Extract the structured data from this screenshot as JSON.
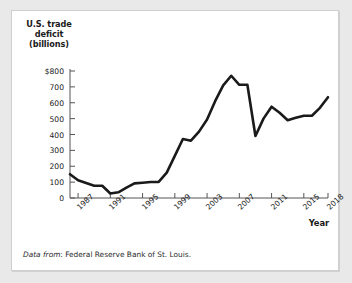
{
  "figure": {
    "y_axis_title": "U.S. trade deficit (billions)",
    "x_axis_title": "Year",
    "source_lead": "Data from",
    "source_text": ": Federal Reserve Bank of St. Louis.",
    "line_color": "#1a1a1a",
    "axis_color": "#555555",
    "panel_background": "#ffffff",
    "page_background": "#e9e9e9"
  },
  "chart_data": {
    "type": "line",
    "title": "",
    "subtitle": "",
    "xlabel": "Year",
    "ylabel": "U.S. trade deficit (billions)",
    "xlim": [
      1986,
      2018
    ],
    "ylim": [
      0,
      800
    ],
    "grid": false,
    "legend": "none",
    "y_ticks": [
      0,
      100,
      200,
      300,
      400,
      500,
      600,
      700,
      800
    ],
    "y_tick_labels": [
      "0",
      "100",
      "200",
      "300",
      "400",
      "500",
      "600",
      "700",
      "$800"
    ],
    "x_ticks": [
      1987,
      1991,
      1995,
      1999,
      2003,
      2007,
      2011,
      2015,
      2018
    ],
    "x_tick_labels": [
      "1987",
      "1991",
      "1995",
      "1999",
      "2003",
      "2007",
      "2011",
      "2015",
      "2018"
    ],
    "series": [
      {
        "name": "U.S. trade deficit",
        "units": "billions of dollars",
        "x": [
          1986,
          1987,
          1988,
          1989,
          1990,
          1991,
          1992,
          1993,
          1994,
          1995,
          1996,
          1997,
          1998,
          1999,
          2000,
          2001,
          2002,
          2003,
          2004,
          2005,
          2006,
          2007,
          2008,
          2009,
          2010,
          2011,
          2012,
          2013,
          2014,
          2015,
          2016,
          2017,
          2018
        ],
        "values": [
          150,
          112,
          94,
          77,
          77,
          28,
          36,
          65,
          92,
          96,
          101,
          101,
          160,
          265,
          372,
          361,
          418,
          494,
          610,
          709,
          770,
          713,
          713,
          391,
          500,
          575,
          537,
          490,
          505,
          518,
          518,
          568,
          635
        ]
      }
    ]
  }
}
